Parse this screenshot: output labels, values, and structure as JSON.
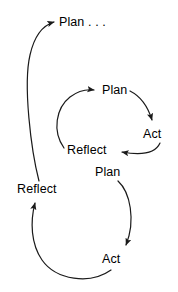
{
  "diagram": {
    "stroke_color": "#1a1a1a",
    "text_color": "#000000",
    "background_color": "#ffffff",
    "stroke_width": 1.2,
    "nodes": {
      "plan_top": "Plan . . .",
      "plan_middle": "Plan",
      "act_middle": "Act",
      "reflect_middle": "Reflect",
      "plan_bottom": "Plan",
      "act_bottom": "Act",
      "reflect_bottom": "Reflect"
    },
    "edges": [
      {
        "name": "bottom-reflect-to-top-plan",
        "from": "reflect_bottom",
        "to": "plan_top",
        "arrow": "up-right"
      },
      {
        "name": "middle-reflect-to-middle-plan",
        "from": "reflect_middle",
        "to": "plan_middle",
        "arrow": "right"
      },
      {
        "name": "middle-plan-to-middle-act",
        "from": "plan_middle",
        "to": "act_middle",
        "arrow": "down-right"
      },
      {
        "name": "middle-act-to-middle-reflect",
        "from": "act_middle",
        "to": "reflect_middle",
        "arrow": "left"
      },
      {
        "name": "bottom-plan-to-bottom-act",
        "from": "plan_bottom",
        "to": "act_bottom",
        "arrow": "down"
      },
      {
        "name": "bottom-act-to-bottom-reflect",
        "from": "act_bottom",
        "to": "reflect_bottom",
        "arrow": "up"
      }
    ]
  }
}
